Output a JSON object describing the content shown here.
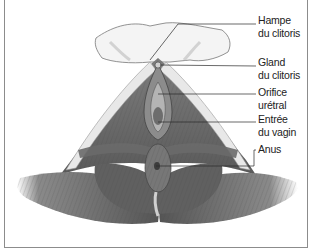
{
  "figure": {
    "type": "anatomical-illustration",
    "labels": [
      {
        "line1": "Hampe",
        "line2": "du clitoris"
      },
      {
        "line1": "Gland",
        "line2": "du clitoris"
      },
      {
        "line1": "Orifice",
        "line2": "urétral"
      },
      {
        "line1": "Entrée",
        "line2": "du vagin"
      },
      {
        "line1": "Anus",
        "line2": ""
      }
    ]
  }
}
